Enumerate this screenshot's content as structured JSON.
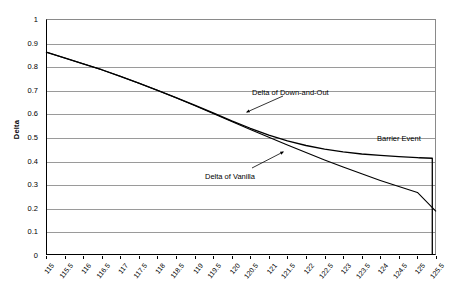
{
  "chart_data": {
    "type": "line",
    "title": "",
    "xlabel": "",
    "ylabel": "Delta",
    "xlim": [
      115,
      125.5
    ],
    "ylim": [
      0,
      1
    ],
    "grid": true,
    "legend_position": "none",
    "y_ticks": [
      "1",
      "0.9",
      "0.8",
      "0.7",
      "0.6",
      "0.5",
      "0.4",
      "0.3",
      "0.2",
      "0.1",
      "0"
    ],
    "y_tick_values": [
      1,
      0.9,
      0.8,
      0.7,
      0.6,
      0.5,
      0.4,
      0.3,
      0.2,
      0.1,
      0
    ],
    "x_ticks": [
      "115",
      "115.5",
      "116",
      "116.5",
      "117",
      "117.5",
      "118",
      "118.5",
      "119",
      "119.5",
      "120",
      "120.5",
      "121",
      "121.5",
      "122",
      "122.5",
      "123",
      "123.5",
      "124",
      "124.5",
      "125",
      "125.5"
    ],
    "x_tick_values": [
      115,
      115.5,
      116,
      116.5,
      117,
      117.5,
      118,
      118.5,
      119,
      119.5,
      120,
      120.5,
      121,
      121.5,
      122,
      122.5,
      123,
      123.5,
      124,
      124.5,
      125,
      125.5
    ],
    "series": [
      {
        "name": "Delta of Down-and-Out",
        "color": "#000000",
        "x": [
          115,
          115.5,
          116,
          116.5,
          117,
          117.5,
          118,
          118.5,
          119,
          119.5,
          120,
          120.5,
          121,
          121.5,
          122,
          122.5,
          123,
          123.5,
          124,
          124.5,
          125,
          125.05,
          125.4,
          125.4
        ],
        "values": [
          0.86,
          0.835,
          0.81,
          0.785,
          0.757,
          0.728,
          0.698,
          0.667,
          0.635,
          0.602,
          0.568,
          0.537,
          0.508,
          0.484,
          0.464,
          0.449,
          0.437,
          0.428,
          0.422,
          0.417,
          0.413,
          0.412,
          0.41,
          0.0
        ]
      },
      {
        "name": "Delta of Vanilla",
        "color": "#000000",
        "x": [
          115,
          115.5,
          116,
          116.5,
          117,
          117.5,
          118,
          118.5,
          119,
          119.5,
          120,
          120.5,
          121,
          121.5,
          122,
          122.5,
          123,
          123.5,
          124,
          124.5,
          125,
          125.5
        ],
        "values": [
          0.86,
          0.835,
          0.81,
          0.785,
          0.757,
          0.728,
          0.698,
          0.666,
          0.633,
          0.6,
          0.566,
          0.532,
          0.499,
          0.466,
          0.434,
          0.403,
          0.373,
          0.344,
          0.316,
          0.29,
          0.265,
          0.185
        ]
      }
    ],
    "annotations": [
      {
        "text": "Delta of Down-and-Out",
        "points_to_x": 120.3,
        "points_to_y": 0.545
      },
      {
        "text": "Delta of Vanilla",
        "points_to_x": 121.6,
        "points_to_y": 0.462
      },
      {
        "text": "Barrier Event",
        "points_to_x": 125.1,
        "points_to_y": 0.41
      }
    ]
  }
}
